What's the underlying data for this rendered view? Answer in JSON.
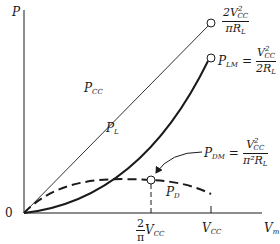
{
  "axes": {
    "y_label": "P",
    "x_label": "V",
    "x_label_sub": "m",
    "origin_label": "0"
  },
  "x_ticks": {
    "two_over_pi": {
      "num": "2",
      "den": "π",
      "var": "V",
      "var_sub": "CC"
    },
    "vcc": {
      "var": "V",
      "var_sub": "CC"
    }
  },
  "curves": {
    "pcc": {
      "label": "P",
      "label_sub": "CC",
      "style": "thin-solid-line"
    },
    "pl": {
      "label": "P",
      "label_sub": "L",
      "style": "thick-solid-curve"
    },
    "pd": {
      "label": "P",
      "label_sub": "D",
      "style": "dashed-curve"
    }
  },
  "annotations": {
    "pcc_max": {
      "num_coef": "2V",
      "num_sup": "2",
      "num_sub": "CC",
      "den": "πR",
      "den_sub": "L"
    },
    "plm": {
      "lhs": "P",
      "lhs_sub": "LM",
      "equals": "=",
      "num": "V",
      "num_sup": "2",
      "num_sub": "CC",
      "den": "2R",
      "den_sub": "L"
    },
    "pdm": {
      "lhs": "P",
      "lhs_sub": "DM",
      "equals": "=",
      "num": "V",
      "num_sup": "2",
      "num_sub": "CC",
      "den": "π²R",
      "den_sub": "L"
    }
  },
  "colors": {
    "ink": "#1a1a1a",
    "background": "#ffffff"
  }
}
